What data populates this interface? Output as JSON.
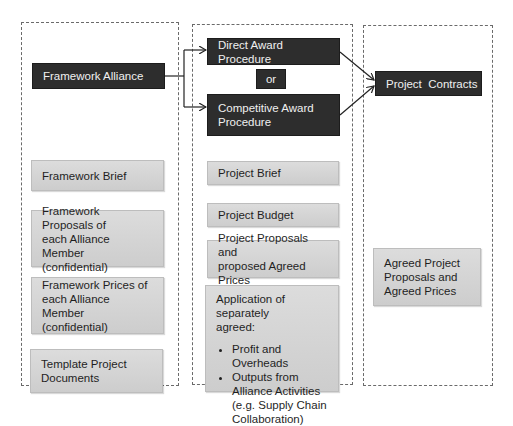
{
  "columns": {
    "framework": {
      "header": "Framework Alliance",
      "items": [
        "Framework Brief",
        [
          "Framework Proposals of",
          "each Alliance Member",
          "(confidential)"
        ],
        [
          "Framework Prices of",
          "each Alliance Member",
          "(confidential)"
        ],
        [
          "Template Project",
          "Documents"
        ]
      ]
    },
    "procedure": {
      "direct": "Direct Award Procedure",
      "or": "or",
      "competitive": [
        "Competitive Award",
        "Procedure"
      ],
      "items": [
        "Project Brief",
        "Project Budget",
        [
          "Project Proposals and",
          "proposed Agreed Prices"
        ]
      ],
      "application": {
        "intro": [
          "Application of separately",
          "agreed:"
        ],
        "bullets": [
          "Profit and Overheads",
          "Outputs from Alliance Activities (e.g. Supply Chain Collaboration)"
        ]
      }
    },
    "contracts": {
      "header": "Project  Contracts",
      "items": [
        [
          "Agreed Project",
          "Proposals and",
          "Agreed Prices"
        ]
      ]
    }
  },
  "colors": {
    "dark_box": "#2d2d2d",
    "light_box": "#d4d4d4",
    "border_dashed": "#6a6a6a",
    "arrow": "#222222"
  }
}
